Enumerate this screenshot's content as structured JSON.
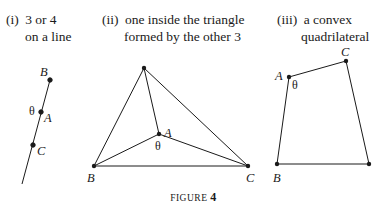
{
  "panels": [
    {
      "number": "(i)",
      "line1": "3 or 4",
      "line2": "on a line",
      "points": [
        "B",
        "A",
        "C"
      ],
      "angle": "θ"
    },
    {
      "number": "(ii)",
      "line1": "one inside the triangle",
      "line2": "formed by the other 3",
      "points": [
        "A",
        "B",
        "C"
      ],
      "angle": "θ"
    },
    {
      "number": "(iii)",
      "line1": "a convex",
      "line2": "quadrilateral",
      "points": [
        "A",
        "C",
        "B"
      ],
      "angle": "θ"
    }
  ],
  "figure": {
    "label": "FIGURE",
    "number": "4"
  }
}
